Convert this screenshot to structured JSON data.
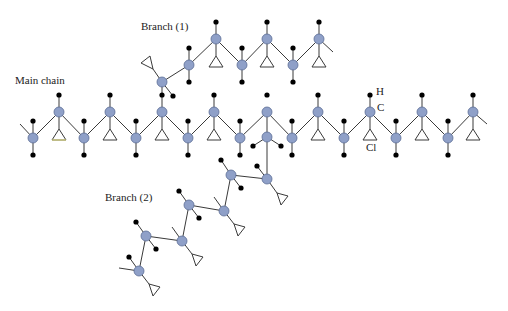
{
  "labels": {
    "main_chain": "Main chain",
    "branch1": "Branch (1)",
    "branch2": "Branch (2)",
    "legend_h": "H",
    "legend_c": "C",
    "legend_cl": "Cl"
  },
  "colors": {
    "carbon": "#8fa0c8",
    "hydrogen": "#000000",
    "bond": "#3a3a3a"
  },
  "legend": {
    "H": "hydrogen atom (black dot)",
    "C": "carbon atom (blue-grey circle)",
    "Cl": "chlorine atom (triangle)"
  },
  "molecule": {
    "carbons": [
      [
        33,
        138
      ],
      [
        59,
        112
      ],
      [
        84,
        138
      ],
      [
        110,
        112
      ],
      [
        136,
        138
      ],
      [
        162,
        112
      ],
      [
        188,
        138
      ],
      [
        214,
        112
      ],
      [
        240,
        138
      ],
      [
        267,
        112
      ],
      [
        292,
        138
      ],
      [
        318,
        112
      ],
      [
        344,
        138
      ],
      [
        370,
        112
      ],
      [
        396,
        138
      ],
      [
        422,
        112
      ],
      [
        448,
        138
      ],
      [
        473,
        112
      ],
      [
        162,
        82
      ],
      [
        189,
        65
      ],
      [
        216,
        39
      ],
      [
        242,
        65
      ],
      [
        267,
        39
      ],
      [
        293,
        65
      ],
      [
        319,
        39
      ],
      [
        267,
        137
      ],
      [
        267,
        179
      ],
      [
        231,
        175
      ],
      [
        224,
        211
      ],
      [
        189,
        205
      ],
      [
        182,
        241
      ],
      [
        146,
        236
      ],
      [
        139,
        271
      ]
    ],
    "bonds": [
      [
        [
          20,
          124
        ],
        [
          33,
          138
        ]
      ],
      [
        [
          33,
          138
        ],
        [
          59,
          112
        ]
      ],
      [
        [
          59,
          112
        ],
        [
          84,
          138
        ]
      ],
      [
        [
          84,
          138
        ],
        [
          110,
          112
        ]
      ],
      [
        [
          110,
          112
        ],
        [
          136,
          138
        ]
      ],
      [
        [
          136,
          138
        ],
        [
          162,
          112
        ]
      ],
      [
        [
          162,
          112
        ],
        [
          188,
          138
        ]
      ],
      [
        [
          188,
          138
        ],
        [
          214,
          112
        ]
      ],
      [
        [
          214,
          112
        ],
        [
          240,
          138
        ]
      ],
      [
        [
          240,
          138
        ],
        [
          267,
          112
        ]
      ],
      [
        [
          267,
          112
        ],
        [
          292,
          138
        ]
      ],
      [
        [
          292,
          138
        ],
        [
          318,
          112
        ]
      ],
      [
        [
          318,
          112
        ],
        [
          344,
          138
        ]
      ],
      [
        [
          344,
          138
        ],
        [
          370,
          112
        ]
      ],
      [
        [
          370,
          112
        ],
        [
          396,
          138
        ]
      ],
      [
        [
          396,
          138
        ],
        [
          422,
          112
        ]
      ],
      [
        [
          422,
          112
        ],
        [
          448,
          138
        ]
      ],
      [
        [
          448,
          138
        ],
        [
          473,
          112
        ]
      ],
      [
        [
          473,
          112
        ],
        [
          487,
          124
        ]
      ],
      [
        [
          162,
          112
        ],
        [
          162,
          82
        ]
      ],
      [
        [
          162,
          82
        ],
        [
          189,
          65
        ]
      ],
      [
        [
          189,
          65
        ],
        [
          216,
          39
        ]
      ],
      [
        [
          216,
          39
        ],
        [
          242,
          65
        ]
      ],
      [
        [
          242,
          65
        ],
        [
          267,
          39
        ]
      ],
      [
        [
          267,
          39
        ],
        [
          293,
          65
        ]
      ],
      [
        [
          293,
          65
        ],
        [
          319,
          39
        ]
      ],
      [
        [
          319,
          39
        ],
        [
          333,
          52
        ]
      ],
      [
        [
          267,
          112
        ],
        [
          267,
          179
        ]
      ],
      [
        [
          267,
          179
        ],
        [
          231,
          175
        ]
      ],
      [
        [
          231,
          175
        ],
        [
          224,
          211
        ]
      ],
      [
        [
          224,
          211
        ],
        [
          189,
          205
        ]
      ],
      [
        [
          189,
          205
        ],
        [
          182,
          241
        ]
      ],
      [
        [
          182,
          241
        ],
        [
          146,
          236
        ]
      ],
      [
        [
          146,
          236
        ],
        [
          139,
          271
        ]
      ],
      [
        [
          139,
          271
        ],
        [
          119,
          268
        ]
      ],
      [
        [
          33,
          138
        ],
        [
          33,
          121
        ]
      ],
      [
        [
          33,
          138
        ],
        [
          33,
          155
        ]
      ],
      [
        [
          84,
          138
        ],
        [
          84,
          121
        ]
      ],
      [
        [
          84,
          138
        ],
        [
          84,
          155
        ]
      ],
      [
        [
          136,
          138
        ],
        [
          136,
          121
        ]
      ],
      [
        [
          136,
          138
        ],
        [
          136,
          155
        ]
      ],
      [
        [
          188,
          138
        ],
        [
          188,
          121
        ]
      ],
      [
        [
          188,
          138
        ],
        [
          188,
          155
        ]
      ],
      [
        [
          240,
          138
        ],
        [
          240,
          121
        ]
      ],
      [
        [
          240,
          138
        ],
        [
          240,
          155
        ]
      ],
      [
        [
          292,
          138
        ],
        [
          292,
          121
        ]
      ],
      [
        [
          292,
          138
        ],
        [
          292,
          155
        ]
      ],
      [
        [
          344,
          138
        ],
        [
          344,
          121
        ]
      ],
      [
        [
          344,
          138
        ],
        [
          344,
          155
        ]
      ],
      [
        [
          396,
          138
        ],
        [
          396,
          121
        ]
      ],
      [
        [
          396,
          138
        ],
        [
          396,
          155
        ]
      ],
      [
        [
          448,
          138
        ],
        [
          448,
          121
        ]
      ],
      [
        [
          448,
          138
        ],
        [
          448,
          155
        ]
      ],
      [
        [
          59,
          112
        ],
        [
          59,
          95
        ]
      ],
      [
        [
          110,
          112
        ],
        [
          110,
          95
        ]
      ],
      [
        [
          214,
          112
        ],
        [
          214,
          95
        ]
      ],
      [
        [
          318,
          112
        ],
        [
          318,
          95
        ]
      ],
      [
        [
          370,
          112
        ],
        [
          370,
          95
        ]
      ],
      [
        [
          422,
          112
        ],
        [
          422,
          95
        ]
      ],
      [
        [
          473,
          112
        ],
        [
          473,
          95
        ]
      ],
      [
        [
          59,
          112
        ],
        [
          59,
          129
        ]
      ],
      [
        [
          110,
          112
        ],
        [
          110,
          129
        ]
      ],
      [
        [
          214,
          112
        ],
        [
          214,
          129
        ]
      ],
      [
        [
          318,
          112
        ],
        [
          318,
          129
        ]
      ],
      [
        [
          370,
          112
        ],
        [
          370,
          129
        ]
      ],
      [
        [
          422,
          112
        ],
        [
          422,
          129
        ]
      ],
      [
        [
          473,
          112
        ],
        [
          473,
          129
        ]
      ],
      [
        [
          162,
          112
        ],
        [
          162,
          129
        ]
      ],
      [
        [
          162,
          82
        ],
        [
          173,
          96
        ]
      ],
      [
        [
          162,
          82
        ],
        [
          153,
          69
        ]
      ],
      [
        [
          189,
          65
        ],
        [
          189,
          48
        ]
      ],
      [
        [
          189,
          65
        ],
        [
          189,
          82
        ]
      ],
      [
        [
          242,
          65
        ],
        [
          242,
          48
        ]
      ],
      [
        [
          242,
          65
        ],
        [
          242,
          82
        ]
      ],
      [
        [
          293,
          65
        ],
        [
          293,
          48
        ]
      ],
      [
        [
          293,
          65
        ],
        [
          293,
          82
        ]
      ],
      [
        [
          216,
          39
        ],
        [
          216,
          22
        ]
      ],
      [
        [
          267,
          39
        ],
        [
          267,
          22
        ]
      ],
      [
        [
          319,
          39
        ],
        [
          319,
          22
        ]
      ],
      [
        [
          216,
          39
        ],
        [
          216,
          56
        ]
      ],
      [
        [
          267,
          39
        ],
        [
          267,
          56
        ]
      ],
      [
        [
          319,
          39
        ],
        [
          319,
          56
        ]
      ],
      [
        [
          267,
          137
        ],
        [
          253,
          146
        ]
      ],
      [
        [
          267,
          137
        ],
        [
          281,
          146
        ]
      ],
      [
        [
          267,
          179
        ],
        [
          257,
          166
        ]
      ],
      [
        [
          267,
          179
        ],
        [
          277,
          193
        ]
      ],
      [
        [
          231,
          175
        ],
        [
          221,
          160
        ]
      ],
      [
        [
          231,
          175
        ],
        [
          241,
          188
        ]
      ],
      [
        [
          224,
          211
        ],
        [
          214,
          197
        ]
      ],
      [
        [
          224,
          211
        ],
        [
          234,
          224
        ]
      ],
      [
        [
          189,
          205
        ],
        [
          179,
          191
        ]
      ],
      [
        [
          189,
          205
        ],
        [
          199,
          218
        ]
      ],
      [
        [
          182,
          241
        ],
        [
          172,
          227
        ]
      ],
      [
        [
          182,
          241
        ],
        [
          192,
          254
        ]
      ],
      [
        [
          146,
          236
        ],
        [
          136,
          222
        ]
      ],
      [
        [
          146,
          236
        ],
        [
          156,
          249
        ]
      ],
      [
        [
          139,
          271
        ],
        [
          129,
          257
        ]
      ],
      [
        [
          139,
          271
        ],
        [
          149,
          284
        ]
      ]
    ],
    "hydrogens": [
      [
        33,
        121
      ],
      [
        33,
        155
      ],
      [
        84,
        121
      ],
      [
        84,
        155
      ],
      [
        136,
        121
      ],
      [
        136,
        155
      ],
      [
        188,
        121
      ],
      [
        188,
        155
      ],
      [
        240,
        121
      ],
      [
        240,
        155
      ],
      [
        292,
        121
      ],
      [
        292,
        155
      ],
      [
        344,
        121
      ],
      [
        344,
        155
      ],
      [
        396,
        121
      ],
      [
        396,
        155
      ],
      [
        448,
        121
      ],
      [
        448,
        155
      ],
      [
        59,
        95
      ],
      [
        110,
        95
      ],
      [
        162,
        95
      ],
      [
        214,
        95
      ],
      [
        267,
        95
      ],
      [
        318,
        95
      ],
      [
        370,
        95
      ],
      [
        422,
        95
      ],
      [
        473,
        95
      ],
      [
        173,
        96
      ],
      [
        189,
        48
      ],
      [
        189,
        82
      ],
      [
        242,
        48
      ],
      [
        242,
        82
      ],
      [
        293,
        48
      ],
      [
        293,
        82
      ],
      [
        216,
        22
      ],
      [
        267,
        22
      ],
      [
        319,
        22
      ],
      [
        253,
        146
      ],
      [
        281,
        146
      ],
      [
        257,
        166
      ],
      [
        221,
        160
      ],
      [
        241,
        188
      ],
      [
        179,
        191
      ],
      [
        199,
        218
      ],
      [
        136,
        222
      ],
      [
        156,
        249
      ],
      [
        129,
        257
      ]
    ],
    "chlorines": [
      [
        [
          59,
          129
        ],
        [
          52,
          140
        ],
        [
          66,
          140
        ]
      ],
      [
        [
          110,
          129
        ],
        [
          103,
          140
        ],
        [
          117,
          140
        ]
      ],
      [
        [
          162,
          129
        ],
        [
          155,
          140
        ],
        [
          169,
          140
        ]
      ],
      [
        [
          214,
          129
        ],
        [
          207,
          140
        ],
        [
          221,
          140
        ]
      ],
      [
        [
          318,
          129
        ],
        [
          311,
          140
        ],
        [
          325,
          140
        ]
      ],
      [
        [
          370,
          129
        ],
        [
          363,
          140
        ],
        [
          377,
          140
        ]
      ],
      [
        [
          422,
          129
        ],
        [
          415,
          140
        ],
        [
          429,
          140
        ]
      ],
      [
        [
          473,
          129
        ],
        [
          466,
          140
        ],
        [
          480,
          140
        ]
      ],
      [
        [
          216,
          56
        ],
        [
          209,
          67
        ],
        [
          223,
          67
        ]
      ],
      [
        [
          267,
          56
        ],
        [
          260,
          67
        ],
        [
          274,
          67
        ]
      ],
      [
        [
          319,
          56
        ],
        [
          312,
          67
        ],
        [
          326,
          67
        ]
      ],
      [
        [
          153,
          69
        ],
        [
          141,
          63
        ],
        [
          150,
          56
        ]
      ],
      [
        [
          277,
          193
        ],
        [
          288,
          196
        ],
        [
          281,
          205
        ]
      ],
      [
        [
          234,
          224
        ],
        [
          245,
          227
        ],
        [
          238,
          236
        ]
      ],
      [
        [
          192,
          254
        ],
        [
          203,
          257
        ],
        [
          196,
          266
        ]
      ],
      [
        [
          149,
          284
        ],
        [
          160,
          287
        ],
        [
          153,
          296
        ]
      ]
    ]
  }
}
